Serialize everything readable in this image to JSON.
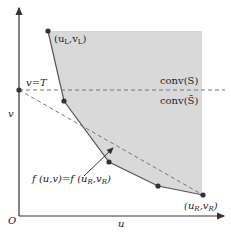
{
  "diagram": {
    "axes": {
      "origin_label": "O",
      "x_label": "u",
      "y_label": "v"
    },
    "colors": {
      "region_fill": "#d9d9d9",
      "line": "#555555",
      "point": "#333333",
      "dashed": "#777777"
    },
    "labels": {
      "left_point": "(u",
      "left_point_sub_u": "L",
      "left_point_mid": ",v",
      "left_point_sub_v": "L",
      "left_point_end": ")",
      "right_point": "(u",
      "right_point_sub_u": "R",
      "right_point_mid": ",v",
      "right_point_sub_v": "R",
      "right_point_end": ")",
      "threshold": "v=T",
      "conv_s": "conv(S)",
      "conv_s_bar": "conv(S̄)",
      "level_set": "f (u,v)=f (u",
      "level_set_sub1": "R",
      "level_set_mid": ",v",
      "level_set_sub2": "R",
      "level_set_end": ")"
    },
    "points": [
      {
        "x": 48,
        "y": 31
      },
      {
        "x": 64,
        "y": 101
      },
      {
        "x": 109,
        "y": 162
      },
      {
        "x": 158,
        "y": 186
      },
      {
        "x": 203,
        "y": 195
      }
    ]
  }
}
